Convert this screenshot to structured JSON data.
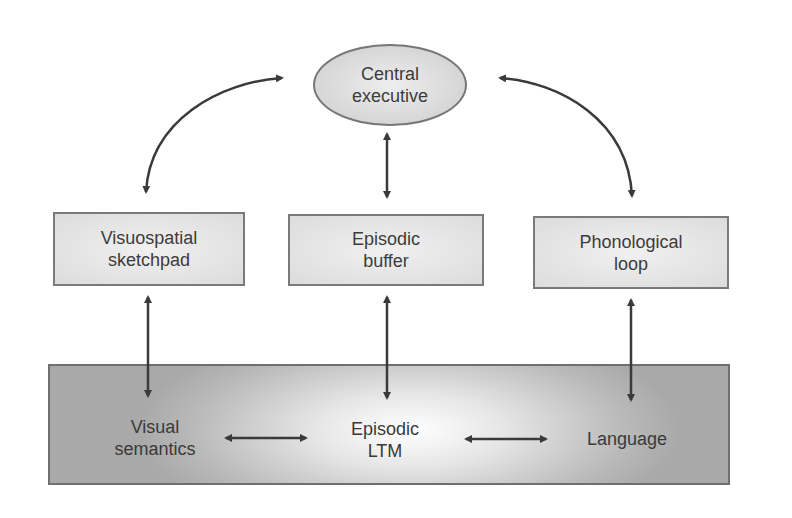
{
  "diagram": {
    "central_executive": {
      "line1": "Central",
      "line2": "executive"
    },
    "subsystems": [
      {
        "line1": "Visuospatial",
        "line2": "sketchpad"
      },
      {
        "line1": "Episodic",
        "line2": "buffer"
      },
      {
        "line1": "Phonological",
        "line2": "loop"
      }
    ],
    "long_term": [
      {
        "line1": "Visual",
        "line2": "semantics"
      },
      {
        "line1": "Episodic",
        "line2": "LTM"
      },
      {
        "line1": "Language",
        "line2": ""
      }
    ],
    "colors": {
      "fill": "#dcdcdc",
      "border": "#777777",
      "arrow": "#3a3a3a",
      "band": "#b0b0b0"
    }
  }
}
